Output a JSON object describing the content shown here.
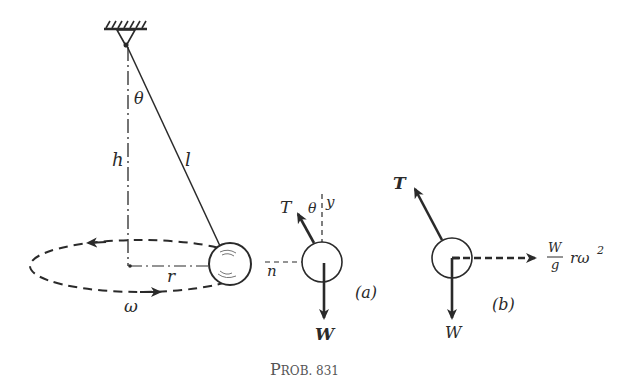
{
  "figure": {
    "caption": "Prob. 831",
    "caption_prefix": "P",
    "caption_rest": "ROB. 831"
  },
  "main_diagram": {
    "labels": {
      "angle": "θ",
      "height": "h",
      "length": "l",
      "radius": "r",
      "angular_velocity": "ω"
    }
  },
  "free_body_a": {
    "label": "(a)",
    "tension": "T",
    "angle": "θ",
    "y_axis": "y",
    "n_axis": "n",
    "weight": "W"
  },
  "free_body_b": {
    "label": "(b)",
    "tension": "T",
    "weight": "W",
    "inertial_force_num": "W",
    "inertial_force_den": "g",
    "inertial_force_rest": "rω",
    "inertial_force_exp": "2"
  },
  "colors": {
    "ink": "#2a2a2a",
    "caption": "#555555",
    "background": "#ffffff"
  }
}
